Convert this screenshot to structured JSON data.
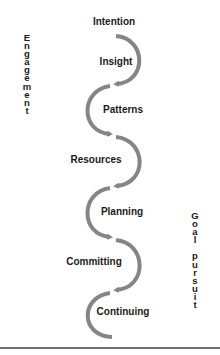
{
  "diagram": {
    "stages": [
      {
        "label": "Intention",
        "x": 114,
        "y": 16
      },
      {
        "label": "Insight",
        "x": 116,
        "y": 56
      },
      {
        "label": "Patterns",
        "x": 123,
        "y": 104
      },
      {
        "label": "Resources",
        "x": 96,
        "y": 154
      },
      {
        "label": "Planning",
        "x": 122,
        "y": 206
      },
      {
        "label": "Committing",
        "x": 94,
        "y": 256
      },
      {
        "label": "Continuing",
        "x": 123,
        "y": 306
      }
    ],
    "left_axis_label": "Engagement",
    "right_axis_label": "Goal pursuit",
    "colors": {
      "arrow": "#858585",
      "text": "#1a1a1a",
      "rule": "#6e6e6e"
    }
  }
}
